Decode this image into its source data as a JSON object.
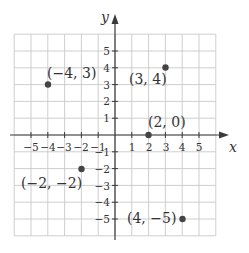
{
  "chart_data": {
    "type": "scatter",
    "title": "",
    "xlabel": "x",
    "ylabel": "y",
    "xlim": [
      -6,
      6
    ],
    "ylim": [
      -6,
      6
    ],
    "grid": true,
    "x_ticks": [
      -5,
      -4,
      -3,
      -2,
      -1,
      1,
      2,
      3,
      4,
      5
    ],
    "y_ticks": [
      5,
      4,
      3,
      2,
      1,
      -1,
      -2,
      -3,
      -4,
      -5
    ],
    "points": [
      {
        "x": -4,
        "y": 3,
        "label": "(−4, 3)"
      },
      {
        "x": 3,
        "y": 4,
        "label": "(3, 4)"
      },
      {
        "x": 2,
        "y": 0,
        "label": "(2, 0)"
      },
      {
        "x": -2,
        "y": -2,
        "label": "(−2, −2)"
      },
      {
        "x": 4,
        "y": -5,
        "label": "(4, −5)"
      }
    ]
  },
  "axes": {
    "x_name": "x",
    "y_name": "y",
    "x_tick_labels": [
      "−5",
      "−4",
      "−3",
      "−2",
      "−1",
      "1",
      "2",
      "3",
      "4",
      "5"
    ],
    "y_tick_labels": [
      "5",
      "4",
      "3",
      "2",
      "1",
      "−1",
      "−2",
      "−3",
      "−4",
      "−5"
    ]
  },
  "colors": {
    "grid": "#c8c8c8",
    "axis": "#3a3a3a",
    "point": "#444444",
    "text": "#333333"
  }
}
